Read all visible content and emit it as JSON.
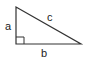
{
  "diagram": {
    "type": "right-triangle",
    "labels": {
      "leg_vertical": "a",
      "leg_horizontal": "b",
      "hypotenuse": "c"
    },
    "right_angle_marker": true,
    "stroke_color": "#333333"
  }
}
